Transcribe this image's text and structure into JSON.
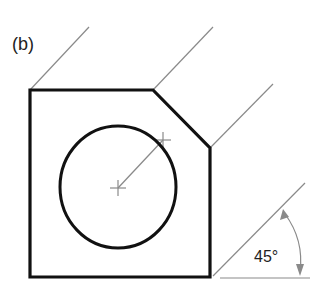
{
  "figure": {
    "label": "(b)",
    "angle_label": "45°"
  },
  "colors": {
    "outline": "#111111",
    "construction": "#8a8a8a",
    "text": "#222222"
  }
}
